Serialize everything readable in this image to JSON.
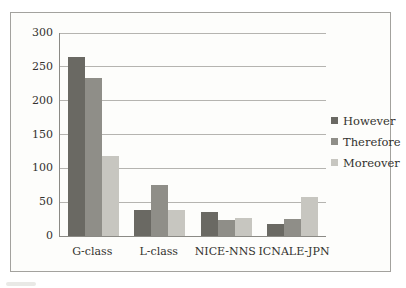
{
  "chart_data": {
    "type": "bar",
    "title": "",
    "xlabel": "",
    "ylabel": "",
    "categories": [
      "G-class",
      "L-class",
      "NICE-NNS",
      "ICNALE-JPN"
    ],
    "series": [
      {
        "name": "However",
        "color": "#6a6963",
        "values": [
          265,
          39,
          35,
          18
        ]
      },
      {
        "name": "Therefore",
        "color": "#8f8e88",
        "values": [
          234,
          76,
          23,
          25
        ]
      },
      {
        "name": "Moreover",
        "color": "#c7c6c0",
        "values": [
          118,
          38,
          27,
          57
        ]
      }
    ],
    "ylim": [
      0,
      300
    ],
    "yticks": [
      0,
      50,
      100,
      150,
      200,
      250,
      300
    ],
    "grid": true,
    "legend_position": "right"
  },
  "style_colors": {
    "frame_border": "#a3a29e",
    "chart_background": "#fdfdfb",
    "page_background": "#ffffff",
    "gridline": "#b5b4b0",
    "axis_line": "#8b8a85",
    "text": "#33322e"
  }
}
